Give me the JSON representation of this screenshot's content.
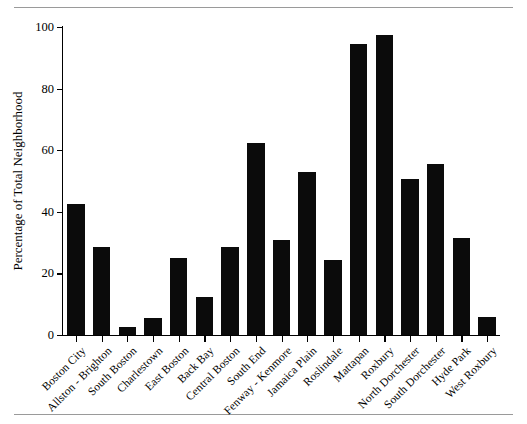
{
  "figure": {
    "name": "neighborhood-percentage-bar-chart",
    "top_rule_color": "#9a9a9a",
    "bottom_rule_color": "#9a9a9a"
  },
  "chart_data": {
    "type": "bar",
    "title": "",
    "xlabel": "",
    "ylabel": "Percentage of Total Neighborhood",
    "ylim": [
      0,
      100
    ],
    "yticks": [
      0,
      20,
      40,
      60,
      80,
      100
    ],
    "ytick_labels": [
      "0",
      "20",
      "40",
      "60",
      "80",
      "100"
    ],
    "grid": false,
    "legend": null,
    "bar_color": "#0b0b0b",
    "categories": [
      "Boston City",
      "Allston - Brighton",
      "South Boston",
      "Charlestown",
      "East Boston",
      "Back Bay",
      "Central Boston",
      "South End",
      "Fenway - Kenmore",
      "Jamaica Plain",
      "Roslindale",
      "Mattapan",
      "Roxbury",
      "North Dorchester",
      "South Dorchester",
      "Hyde Park",
      "West Roxbury"
    ],
    "values": [
      42.5,
      28.5,
      2.5,
      5.5,
      25.0,
      12.5,
      28.5,
      62.5,
      30.8,
      53.0,
      24.5,
      94.5,
      97.5,
      50.5,
      55.5,
      31.5,
      6.0
    ]
  }
}
